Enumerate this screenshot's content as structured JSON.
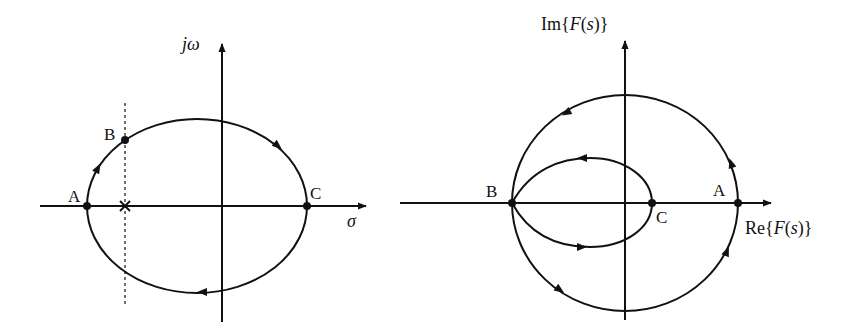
{
  "colors": {
    "ink": "#111111",
    "background": "#ffffff"
  },
  "left_diagram": {
    "title": "s-plane contour",
    "vertical_axis_label": "jω",
    "horizontal_axis_label": "σ",
    "points": [
      {
        "label": "A",
        "description": "leftmost point of contour on real axis"
      },
      {
        "label": "B",
        "description": "point on contour where dashed line crosses"
      },
      {
        "label": "C",
        "description": "rightmost point of contour on real axis"
      }
    ],
    "pole_marker": "×",
    "contour_direction": "clockwise"
  },
  "right_diagram": {
    "title": "F(s)-plane mapping",
    "vertical_axis_label": {
      "prefix": "Im{",
      "func": "F",
      "open": "(",
      "var": "s",
      "close": ")}"
    },
    "horizontal_axis_label": {
      "prefix": "Re{",
      "func": "F",
      "open": "(",
      "var": "s",
      "close": ")}"
    },
    "points": [
      {
        "label": "B",
        "description": "leftmost point where outer and inner loops meet"
      },
      {
        "label": "C",
        "description": "rightmost point of inner loop"
      },
      {
        "label": "A",
        "description": "rightmost point of outer loop"
      }
    ],
    "contour_direction": "counterclockwise"
  }
}
